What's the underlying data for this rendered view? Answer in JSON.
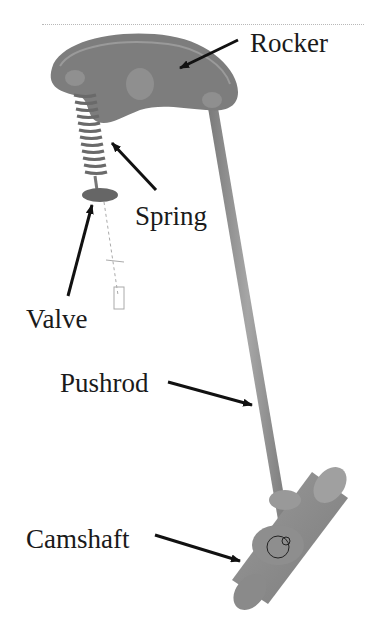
{
  "diagram": {
    "type": "mechanical-assembly",
    "labels": {
      "rocker": "Rocker",
      "spring": "Spring",
      "valve": "Valve",
      "pushrod": "Pushrod",
      "camshaft": "Camshaft"
    },
    "colors": {
      "part_dark": "#6e6e6e",
      "part_mid": "#8c8c8c",
      "part_light": "#a8a8a8",
      "arrow": "#111111",
      "text": "#1a1a1a"
    }
  }
}
